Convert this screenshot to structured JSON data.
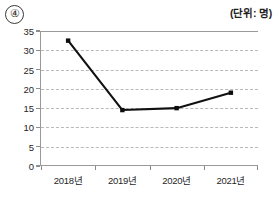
{
  "header": {
    "item_number": "④",
    "unit_label": "(단위: 명)"
  },
  "chart_data": {
    "type": "line",
    "title": "",
    "xlabel": "",
    "ylabel": "",
    "unit": "명",
    "categories": [
      "2018년",
      "2019년",
      "2020년",
      "2021년"
    ],
    "values": [
      32.5,
      14.5,
      15,
      19
    ],
    "series": [
      {
        "name": "명",
        "values": [
          32.5,
          14.5,
          15,
          19
        ]
      }
    ],
    "ylim": [
      0,
      35
    ],
    "ytick_values": [
      0,
      5,
      10,
      15,
      20,
      25,
      30,
      35
    ],
    "ytick_labels": [
      "0",
      "5",
      "10",
      "15",
      "20",
      "25",
      "30",
      "35"
    ],
    "grid": true,
    "grid_style": "dashed-horizontal",
    "legend": false,
    "legend_position": "none",
    "line_color": "#111111",
    "marker": "square",
    "marker_color": "#0d0d0d",
    "axis_color": "#9a9a9a",
    "grid_color": "#b9b9b9"
  }
}
